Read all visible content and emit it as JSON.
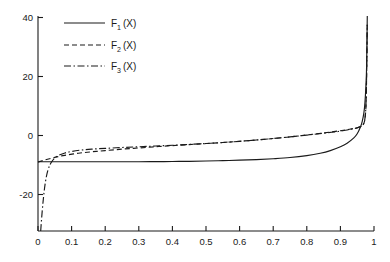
{
  "chart_data": {
    "type": "line",
    "title": "",
    "xlabel": "",
    "ylabel": "",
    "xlim": [
      0,
      1
    ],
    "ylim": [
      -30,
      43
    ],
    "grid": false,
    "legend_position": "top-left",
    "x_ticks": [
      0,
      0.1,
      0.2,
      0.3,
      0.4,
      0.5,
      0.6,
      0.7,
      0.8,
      0.9,
      1
    ],
    "x_tick_labels": [
      "0",
      "0.1",
      "0.2",
      "0.3",
      "0.4",
      "0.5",
      "0.6",
      "0.7",
      "0.8",
      "0.9",
      "1"
    ],
    "y_ticks": [
      -20,
      0,
      20,
      40
    ],
    "y_tick_labels": [
      "-20",
      "0",
      "20",
      "40"
    ],
    "series": [
      {
        "name": "F1 (X)",
        "label_base": "F",
        "label_sub": "1",
        "label_arg": "(X)",
        "style": "solid",
        "x": [
          0.0,
          0.05,
          0.1,
          0.15,
          0.2,
          0.25,
          0.3,
          0.35,
          0.4,
          0.45,
          0.5,
          0.55,
          0.6,
          0.65,
          0.7,
          0.75,
          0.8,
          0.84,
          0.87,
          0.9,
          0.92,
          0.94,
          0.95,
          0.96,
          0.965,
          0.97,
          0.973,
          0.976,
          0.978,
          0.98
        ],
        "y": [
          -6.5,
          -6.5,
          -6.5,
          -6.5,
          -6.5,
          -6.5,
          -6.5,
          -6.45,
          -6.4,
          -6.35,
          -6.25,
          -6.1,
          -5.95,
          -5.75,
          -5.45,
          -5.05,
          -4.4,
          -3.6,
          -2.7,
          -1.4,
          -0.2,
          1.6,
          3.0,
          5.4,
          7.2,
          10.2,
          13.5,
          19.5,
          26.0,
          43.0
        ]
      },
      {
        "name": "F2 (X)",
        "label_base": "F",
        "label_sub": "2",
        "label_arg": "(X)",
        "style": "dashed",
        "x": [
          0.0,
          0.02,
          0.05,
          0.08,
          0.12,
          0.16,
          0.2,
          0.25,
          0.3,
          0.35,
          0.4,
          0.45,
          0.5,
          0.55,
          0.6,
          0.65,
          0.7,
          0.75,
          0.8,
          0.85,
          0.88,
          0.9,
          0.92,
          0.94,
          0.95,
          0.96,
          0.965,
          0.97,
          0.974,
          0.977,
          0.98
        ],
        "y": [
          -6.6,
          -5.9,
          -5.0,
          -4.3,
          -3.6,
          -3.1,
          -2.7,
          -2.2,
          -1.8,
          -1.4,
          -1.0,
          -0.65,
          -0.3,
          0.05,
          0.45,
          0.9,
          1.4,
          1.95,
          2.6,
          3.3,
          3.75,
          4.05,
          4.4,
          4.8,
          5.05,
          5.45,
          5.8,
          6.6,
          9.0,
          16.0,
          40.0
        ]
      },
      {
        "name": "F3 (X)",
        "label_base": "F",
        "label_sub": "3",
        "label_arg": "(X)",
        "style": "dashdot",
        "x": [
          0.008,
          0.012,
          0.016,
          0.02,
          0.025,
          0.03,
          0.035,
          0.04,
          0.05,
          0.06,
          0.08,
          0.1,
          0.13,
          0.16,
          0.2,
          0.25,
          0.3,
          0.35,
          0.4,
          0.45,
          0.5,
          0.55,
          0.6,
          0.65,
          0.7,
          0.75,
          0.8,
          0.85,
          0.88,
          0.9,
          0.92,
          0.94,
          0.95,
          0.96,
          0.965,
          0.97,
          0.974,
          0.977,
          0.98
        ],
        "y": [
          -30.0,
          -24.0,
          -19.0,
          -15.0,
          -11.5,
          -9.2,
          -7.7,
          -6.6,
          -5.2,
          -4.4,
          -3.5,
          -3.0,
          -2.5,
          -2.2,
          -1.95,
          -1.65,
          -1.4,
          -1.15,
          -0.9,
          -0.6,
          -0.3,
          0.05,
          0.45,
          0.9,
          1.4,
          1.95,
          2.55,
          3.2,
          3.6,
          3.9,
          4.3,
          4.75,
          5.0,
          5.45,
          5.85,
          6.7,
          9.2,
          16.5,
          40.0
        ]
      }
    ]
  }
}
